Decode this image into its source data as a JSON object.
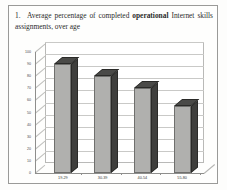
{
  "figure": {
    "number": "1.",
    "caption_part1": "Average percentage of completed ",
    "caption_bold": "operational",
    "caption_part2": " Internet skills assignments, over age"
  },
  "chart_data": {
    "type": "bar",
    "title": "",
    "xlabel": "",
    "ylabel": "",
    "categories": [
      "19-29",
      "30-39",
      "40-54",
      "55-80"
    ],
    "values": [
      90,
      80,
      70,
      55
    ],
    "ylim": [
      0,
      100
    ],
    "yticks": [
      "0",
      "10",
      "20",
      "30",
      "40",
      "50",
      "60",
      "70",
      "80",
      "90",
      "100"
    ],
    "grid": true,
    "legend": "none",
    "style": "3d-column",
    "colors": {
      "bar_front": "#b0b0ae",
      "bar_top": "#4a4a48",
      "bar_side": "#3f3f3d",
      "gridline": "#c9c9c7",
      "axis": "#8e8e8c",
      "plot_background": "#ffffff"
    }
  }
}
